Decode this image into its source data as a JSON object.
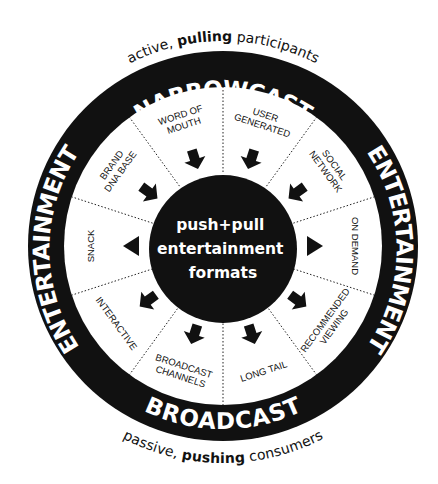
{
  "diagram": {
    "title": "push+pull entertainment formats",
    "center_lines": [
      "push+pull",
      "entertainment",
      "formats"
    ],
    "ring": {
      "top": "NARROWCAST",
      "bottom": "BROADCAST",
      "left": "ENTERTAINMENT",
      "right": "ENTERTAINMENT"
    },
    "captions": {
      "top": {
        "pre": "active, ",
        "bold": "pulling",
        "post": " participants"
      },
      "bottom": {
        "pre": "passive, ",
        "bold": "pushing",
        "post": " consumers"
      }
    },
    "segments": [
      {
        "label_lines": [
          "USER",
          "GENERATED"
        ],
        "arrow": "inward"
      },
      {
        "label_lines": [
          "SOCIAL",
          "NETWORK"
        ],
        "arrow": "inward"
      },
      {
        "label_lines": [
          "ON DEMAND"
        ],
        "arrow": "outward-triangle"
      },
      {
        "label_lines": [
          "RECOMMENDED",
          "VIEWING"
        ],
        "arrow": "outward"
      },
      {
        "label_lines": [
          "LONG TAIL"
        ],
        "arrow": "outward"
      },
      {
        "label_lines": [
          "BROADCAST",
          "CHANNELS"
        ],
        "arrow": "outward"
      },
      {
        "label_lines": [
          "INTERACTIVE"
        ],
        "arrow": "outward"
      },
      {
        "label_lines": [
          "SNACK"
        ],
        "arrow": "outward-triangle"
      },
      {
        "label_lines": [
          "BRAND",
          "DNA BASE"
        ],
        "arrow": "inward"
      },
      {
        "label_lines": [
          "WORD OF",
          "MOUTH"
        ],
        "arrow": "inward"
      }
    ],
    "colors": {
      "ink": "#111111",
      "paper": "#ffffff"
    }
  }
}
